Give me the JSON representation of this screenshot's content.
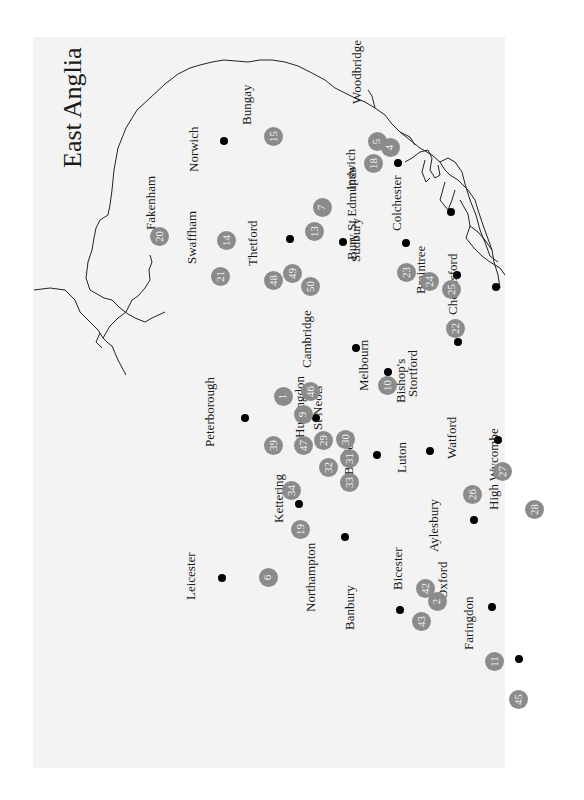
{
  "title": "East Anglia",
  "title_pos": {
    "x": 58,
    "y": 168
  },
  "colors": {
    "panel": "#f3f3f3",
    "marker": "#8b8b8b",
    "marker_text": "#f4f4f4",
    "dot": "#000000",
    "coast": "#222222"
  },
  "towns": [
    {
      "name": "Norwich",
      "dot": [
        224,
        141
      ],
      "label": [
        187,
        172
      ]
    },
    {
      "name": "Ipswich",
      "dot": [
        398,
        163
      ],
      "label": [
        344,
        190
      ]
    },
    {
      "name": "Woodbridge",
      "label": [
        350,
        104
      ]
    },
    {
      "name": "Fakenham",
      "label": [
        144,
        230
      ]
    },
    {
      "name": "Bungay",
      "label": [
        240,
        125
      ]
    },
    {
      "name": "Swaffham",
      "label": [
        185,
        264
      ]
    },
    {
      "name": "Thetford",
      "dot": [
        290,
        239
      ],
      "label": [
        246,
        266
      ]
    },
    {
      "name": "Bury St Edmunds",
      "dot": [
        343,
        242
      ],
      "label": [
        345,
        260
      ]
    },
    {
      "name": "Colchester",
      "dot": [
        451,
        212
      ],
      "label": [
        390,
        231
      ]
    },
    {
      "name": "Sudbury",
      "dot": [
        406,
        243
      ],
      "label": [
        349,
        262
      ]
    },
    {
      "name": "Braintree",
      "dot": [
        457,
        275
      ],
      "label": [
        414,
        294
      ]
    },
    {
      "name": "Chelmsford",
      "dot": [
        496,
        287
      ],
      "label": [
        446,
        315
      ]
    },
    {
      "name": "Cambridge",
      "dot": [
        356,
        348
      ],
      "label": [
        300,
        368
      ]
    },
    {
      "name": "Melbourn",
      "dot": [
        388,
        372
      ],
      "label": [
        357,
        391
      ]
    },
    {
      "name": "Bishop's",
      "label": [
        394,
        403
      ]
    },
    {
      "name": "Stortford",
      "dot": [
        458,
        342
      ],
      "label": [
        406,
        397
      ]
    },
    {
      "name": "Peterborough",
      "dot": [
        245,
        418
      ],
      "label": [
        203,
        447
      ]
    },
    {
      "name": "Huntingdon",
      "dot": [
        316,
        418
      ],
      "label": [
        293,
        438
      ]
    },
    {
      "name": "St Neots",
      "label": [
        311,
        430
      ]
    },
    {
      "name": "Bedford",
      "dot": [
        377,
        455
      ],
      "label": [
        342,
        475
      ]
    },
    {
      "name": "Luton",
      "dot": [
        430,
        451
      ],
      "label": [
        395,
        473
      ]
    },
    {
      "name": "Watford",
      "dot": [
        498,
        440
      ],
      "label": [
        445,
        459
      ]
    },
    {
      "name": "Kettering",
      "dot": [
        299,
        504
      ],
      "label": [
        272,
        523
      ]
    },
    {
      "name": "Northampton",
      "dot": [
        345,
        537
      ],
      "label": [
        304,
        612
      ]
    },
    {
      "name": "Aylesbury",
      "dot": [
        474,
        520
      ],
      "label": [
        427,
        552
      ]
    },
    {
      "name": "High Wycombe",
      "label": [
        487,
        510
      ]
    },
    {
      "name": "Leicester",
      "dot": [
        222,
        578
      ],
      "label": [
        184,
        600
      ]
    },
    {
      "name": "Bicester",
      "label": [
        391,
        590
      ]
    },
    {
      "name": "Oxford",
      "dot": [
        492,
        607
      ],
      "label": [
        436,
        599
      ]
    },
    {
      "name": "Banbury",
      "dot": [
        400,
        610
      ],
      "label": [
        343,
        630
      ]
    },
    {
      "name": "Faringdon",
      "dot": [
        519,
        659
      ],
      "label": [
        462,
        650
      ]
    }
  ],
  "markers": [
    {
      "n": "1",
      "x": 283,
      "y": 396
    },
    {
      "n": "2",
      "x": 437,
      "y": 601
    },
    {
      "n": "4",
      "x": 390,
      "y": 147
    },
    {
      "n": "5",
      "x": 377,
      "y": 141
    },
    {
      "n": "6",
      "x": 268,
      "y": 577
    },
    {
      "n": "7",
      "x": 322,
      "y": 207
    },
    {
      "n": "9",
      "x": 303,
      "y": 414
    },
    {
      "n": "10",
      "x": 387,
      "y": 385
    },
    {
      "n": "11",
      "x": 494,
      "y": 661
    },
    {
      "n": "13",
      "x": 314,
      "y": 231
    },
    {
      "n": "14",
      "x": 226,
      "y": 240
    },
    {
      "n": "15",
      "x": 273,
      "y": 136
    },
    {
      "n": "18",
      "x": 373,
      "y": 163
    },
    {
      "n": "19",
      "x": 300,
      "y": 529
    },
    {
      "n": "20",
      "x": 159,
      "y": 236
    },
    {
      "n": "21",
      "x": 220,
      "y": 276
    },
    {
      "n": "22",
      "x": 455,
      "y": 328
    },
    {
      "n": "23",
      "x": 406,
      "y": 272
    },
    {
      "n": "24",
      "x": 429,
      "y": 281
    },
    {
      "n": "25",
      "x": 451,
      "y": 289
    },
    {
      "n": "26",
      "x": 472,
      "y": 494
    },
    {
      "n": "27",
      "x": 502,
      "y": 471
    },
    {
      "n": "28",
      "x": 534,
      "y": 509
    },
    {
      "n": "29",
      "x": 323,
      "y": 440
    },
    {
      "n": "30",
      "x": 345,
      "y": 439
    },
    {
      "n": "31",
      "x": 349,
      "y": 458
    },
    {
      "n": "32",
      "x": 328,
      "y": 467
    },
    {
      "n": "33",
      "x": 349,
      "y": 482
    },
    {
      "n": "34",
      "x": 291,
      "y": 490
    },
    {
      "n": "39",
      "x": 273,
      "y": 445
    },
    {
      "n": "42",
      "x": 425,
      "y": 588
    },
    {
      "n": "43",
      "x": 421,
      "y": 621
    },
    {
      "n": "45",
      "x": 518,
      "y": 699
    },
    {
      "n": "46",
      "x": 310,
      "y": 391
    },
    {
      "n": "47",
      "x": 303,
      "y": 445
    },
    {
      "n": "48",
      "x": 273,
      "y": 280
    },
    {
      "n": "49",
      "x": 292,
      "y": 273
    },
    {
      "n": "50",
      "x": 310,
      "y": 286
    }
  ]
}
